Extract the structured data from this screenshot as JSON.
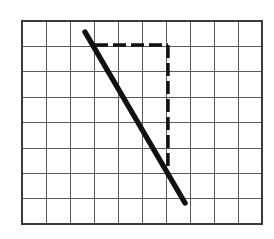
{
  "figure": {
    "background_color": "#ffffff"
  },
  "grid": {
    "columns": 10,
    "rows": 8,
    "cell_width": 24,
    "cell_height": 25.4,
    "origin_x": 22,
    "origin_y": 21,
    "width": 240,
    "height": 203,
    "line_color": "#5a5a5a",
    "border_color": "#3a3a3a",
    "line_width": 1,
    "border_width": 1.6
  },
  "chart_data": {
    "type": "line",
    "xlabel": "",
    "ylabel": "",
    "grid": true,
    "legend": "none",
    "xlim": [
      0,
      10
    ],
    "ylim": [
      0,
      8
    ],
    "series": [
      {
        "name": "slope-line",
        "style": "solid",
        "color": "#111111",
        "thickness": 5.4,
        "x": [
          2.63,
          6.79
        ],
        "y": [
          7.57,
          6.73
        ],
        "pixel_start": [
          85,
          32
        ],
        "pixel_end": [
          185,
          203
        ],
        "comment": "thick solid diagonal falling left-to-right"
      }
    ],
    "annotations": [
      {
        "name": "run-segment",
        "style": "dashed",
        "color": "#111111",
        "orientation": "horizontal",
        "pixel_start": [
          95,
          45
        ],
        "pixel_end": [
          168,
          45
        ],
        "grid_cells": 3
      },
      {
        "name": "rise-segment",
        "style": "dashed",
        "color": "#111111",
        "orientation": "vertical",
        "pixel_start": [
          168,
          45
        ],
        "pixel_end": [
          168,
          167
        ],
        "grid_cells": 5
      }
    ]
  },
  "slope_line": {
    "label": "slope-line",
    "color": "#111111",
    "x1": 85,
    "y1": 32,
    "x2": 185,
    "y2": 203,
    "stroke_width": 5.4
  },
  "run_segment": {
    "label": "run-dashed-segment",
    "color": "#111111",
    "x1": 95,
    "y1": 45,
    "x2": 168,
    "y2": 45,
    "dash_pattern": "13 5",
    "stroke_width": 3.4
  },
  "rise_segment": {
    "label": "rise-dashed-segment",
    "color": "#111111",
    "x1": 168,
    "y1": 45,
    "x2": 168,
    "y2": 167,
    "dash_pattern": "13 5",
    "stroke_width": 3.4
  }
}
